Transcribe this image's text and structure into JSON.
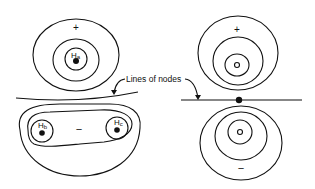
{
  "diagram": {
    "left_panel": {
      "top_lobe": {
        "sign": "+",
        "nucleus_label_main": "H",
        "nucleus_label_sub": "a"
      },
      "bottom_lobe": {
        "sign": "−",
        "nucleus_b_main": "H",
        "nucleus_b_sub": "b",
        "nucleus_c_main": "H",
        "nucleus_c_sub": "c"
      }
    },
    "right_panel": {
      "top_lobe": {
        "sign": "+"
      },
      "bottom_lobe": {
        "sign": "−"
      }
    },
    "annotation": "Lines of nodes",
    "colors": {
      "line": "#111111",
      "background": "#ffffff"
    }
  }
}
